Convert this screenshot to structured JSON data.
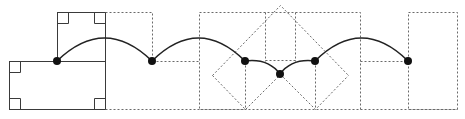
{
  "diagram": {
    "title": "",
    "width": 465,
    "height": 119,
    "colors": {
      "solid_stroke": "#3a3a3a",
      "dashed_stroke": "#6a6a6a",
      "arc_stroke": "#222222",
      "node_fill": "#111111",
      "background": "#ffffff"
    },
    "nodes": [
      {
        "id": "n1",
        "x": 57,
        "y": 61
      },
      {
        "id": "n2",
        "x": 152,
        "y": 61
      },
      {
        "id": "n3",
        "x": 245,
        "y": 61
      },
      {
        "id": "n4",
        "x": 280,
        "y": 74
      },
      {
        "id": "n5",
        "x": 315,
        "y": 61
      },
      {
        "id": "n6",
        "x": 408,
        "y": 61
      }
    ],
    "arcs": [
      {
        "from": "n1",
        "to": "n2",
        "peak_y": 38
      },
      {
        "from": "n2",
        "to": "n3",
        "peak_y": 38
      },
      {
        "from": "n3",
        "to": "n4",
        "peak_y": 64
      },
      {
        "from": "n4",
        "to": "n5",
        "peak_y": 64
      },
      {
        "from": "n5",
        "to": "n6",
        "peak_y": 38
      }
    ],
    "solid_shapes": {
      "left_box": {
        "x": 9,
        "y": 61,
        "w": 96,
        "h": 48
      },
      "top_box": {
        "x": 57,
        "y": 12,
        "w": 48,
        "h": 49
      },
      "divider_x": 105,
      "right_angle_markers": 6
    },
    "dashed_shapes": {
      "boxes": 3,
      "diamonds": 2,
      "diamond_apex": {
        "x": 280,
        "y": 5
      }
    },
    "labels": []
  }
}
